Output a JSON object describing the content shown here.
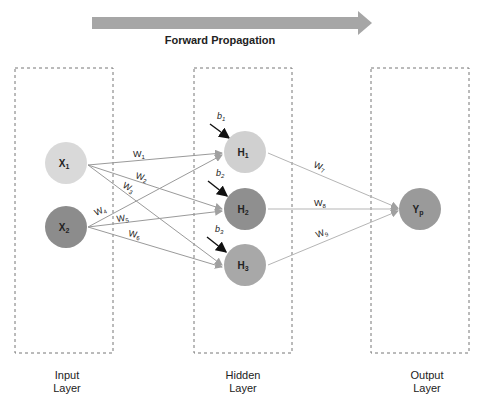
{
  "title": "Forward Propagation",
  "arrow_color": "#a6a6a6",
  "layers": [
    {
      "name": "Input",
      "label_line1": "Input",
      "label_line2": "Layer"
    },
    {
      "name": "Hidden",
      "label_line1": "Hidden",
      "label_line2": "Layer"
    },
    {
      "name": "Output",
      "label_line1": "Output",
      "label_line2": "Layer"
    }
  ],
  "nodes": {
    "x1": {
      "label": "X",
      "sub": "1",
      "color": "#d9d9d9"
    },
    "x2": {
      "label": "X",
      "sub": "2",
      "color": "#8c8c8c"
    },
    "h1": {
      "label": "H",
      "sub": "1",
      "color": "#d0d0d0"
    },
    "h2": {
      "label": "H",
      "sub": "2",
      "color": "#8f8f8f"
    },
    "h3": {
      "label": "H",
      "sub": "3",
      "color": "#a8a8a8"
    },
    "yp": {
      "label": "Y",
      "sub": "p",
      "color": "#9a9a9a"
    }
  },
  "weights": {
    "w1": {
      "label": "W",
      "sub": "1"
    },
    "w2": {
      "label": "W",
      "sub": "2"
    },
    "w3": {
      "label": "W",
      "sub": "3"
    },
    "w4": {
      "label": "W",
      "sub": "4"
    },
    "w5": {
      "label": "W",
      "sub": "5"
    },
    "w6": {
      "label": "W",
      "sub": "6"
    },
    "w7": {
      "label": "W",
      "sub": "7"
    },
    "w8": {
      "label": "W",
      "sub": "8"
    },
    "w9": {
      "label": "W",
      "sub": "9"
    }
  },
  "biases": {
    "b1": {
      "label": "b",
      "sub": "1"
    },
    "b2": {
      "label": "b",
      "sub": "2"
    },
    "b3": {
      "label": "b",
      "sub": "3"
    }
  }
}
